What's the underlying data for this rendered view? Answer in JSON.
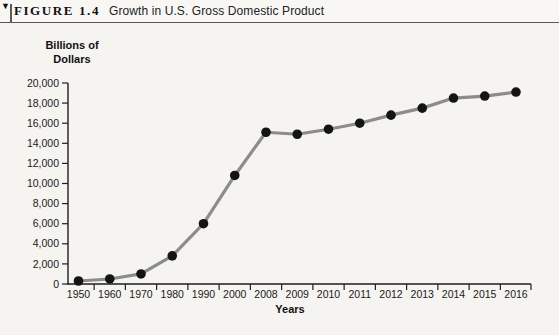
{
  "figure": {
    "marker": "▼",
    "label": "FIGURE 1.4",
    "title": "Growth in U.S. Gross Domestic Product"
  },
  "chart_data": {
    "type": "line",
    "title": "Growth in U.S. Gross Domestic Product",
    "xlabel": "Years",
    "ylabel": "Billions of Dollars",
    "ylabel_lines": [
      "Billions of",
      "Dollars"
    ],
    "categories": [
      "1950",
      "1960",
      "1970",
      "1980",
      "1990",
      "2000",
      "2008",
      "2009",
      "2010",
      "2011",
      "2012",
      "2013",
      "2014",
      "2015",
      "2016"
    ],
    "values": [
      300,
      500,
      1000,
      2800,
      6000,
      10800,
      15100,
      14900,
      15400,
      16000,
      16800,
      17500,
      18500,
      18700,
      19100
    ],
    "ylim": [
      0,
      20000
    ],
    "ytick_step": 2000,
    "ytick_labels": [
      "0",
      "2,000",
      "4,000",
      "6,000",
      "8,000",
      "10,000",
      "12,000",
      "14,000",
      "16,000",
      "18,000",
      "20,000"
    ],
    "grid": false,
    "legend": "none",
    "line_color": "#8c8c8c",
    "point_color": "#141414",
    "axis_color": "#1f1f1f"
  }
}
